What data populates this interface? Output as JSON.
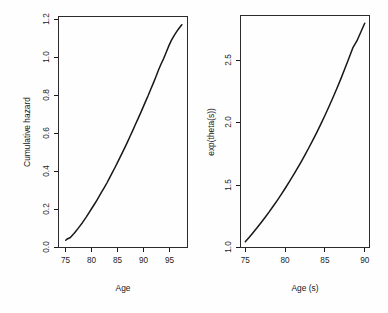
{
  "figure": {
    "background_color": "#fefefe",
    "foreground_color": "#171717",
    "panel_count": 2
  },
  "chart_data": [
    {
      "type": "line",
      "panel": "left",
      "title": "",
      "xlabel": "Age",
      "ylabel": "Cumulative hazard",
      "xlim": [
        73.6,
        98.6
      ],
      "ylim": [
        -0.035,
        1.235
      ],
      "xticks": [
        75,
        80,
        85,
        90,
        95
      ],
      "xticklabels": [
        "75",
        "80",
        "85",
        "90",
        "95"
      ],
      "yticks": [
        0.0,
        0.2,
        0.4,
        0.6,
        0.8,
        1.0,
        1.2
      ],
      "yticklabels": [
        "0.0",
        "0.2",
        "0.4",
        "0.6",
        "0.8",
        "1.0",
        "1.2"
      ],
      "grid": false,
      "legend": null,
      "series": [
        {
          "name": "Nelson-Aalen cumulative hazard",
          "x": [
            75.0,
            75.3,
            75.6,
            75.9,
            76.2,
            76.6,
            77.0,
            77.4,
            77.8,
            78.2,
            78.6,
            79.0,
            79.5,
            80.0,
            80.5,
            81.0,
            81.5,
            82.0,
            82.5,
            83.0,
            83.5,
            84.0,
            84.5,
            85.0,
            85.5,
            86.0,
            86.5,
            87.0,
            87.5,
            88.0,
            88.5,
            89.0,
            89.5,
            90.0,
            90.5,
            91.0,
            91.5,
            92.0,
            92.5,
            93.0,
            93.5,
            94.0,
            94.5,
            95.0,
            95.5,
            96.0,
            96.5,
            97.0,
            97.5
          ],
          "y": [
            0.005,
            0.012,
            0.016,
            0.02,
            0.03,
            0.042,
            0.056,
            0.07,
            0.085,
            0.1,
            0.117,
            0.133,
            0.155,
            0.178,
            0.2,
            0.223,
            0.247,
            0.272,
            0.296,
            0.321,
            0.348,
            0.375,
            0.402,
            0.43,
            0.459,
            0.488,
            0.517,
            0.547,
            0.578,
            0.609,
            0.641,
            0.672,
            0.704,
            0.737,
            0.77,
            0.802,
            0.836,
            0.87,
            0.905,
            0.942,
            0.975,
            1.005,
            1.04,
            1.075,
            1.105,
            1.13,
            1.152,
            1.172,
            1.19
          ]
        }
      ]
    },
    {
      "type": "line",
      "panel": "right",
      "title": "",
      "xlabel": "Age (s)",
      "ylabel": "exp(theta(s))",
      "xlim": [
        74.4,
        90.6
      ],
      "ylim": [
        0.955,
        2.76
      ],
      "xticks": [
        75,
        80,
        85,
        90
      ],
      "xticklabels": [
        "75",
        "80",
        "85",
        "90"
      ],
      "yticks": [
        1.0,
        1.5,
        2.0,
        2.5
      ],
      "yticklabels": [
        "1.0",
        "1.5",
        "2.0",
        "2.5"
      ],
      "grid": false,
      "legend": null,
      "series": [
        {
          "name": "exp(theta(s))",
          "x": [
            75.0,
            75.5,
            76.0,
            76.5,
            77.0,
            77.5,
            78.0,
            78.5,
            79.0,
            79.5,
            80.0,
            80.5,
            81.0,
            81.5,
            82.0,
            82.5,
            83.0,
            83.5,
            84.0,
            84.5,
            85.0,
            85.5,
            86.0,
            86.5,
            87.0,
            87.5,
            88.0,
            88.5,
            89.0,
            89.5,
            90.0
          ],
          "y": [
            1.0,
            1.035,
            1.072,
            1.11,
            1.15,
            1.19,
            1.232,
            1.276,
            1.32,
            1.366,
            1.414,
            1.463,
            1.514,
            1.566,
            1.62,
            1.676,
            1.733,
            1.792,
            1.853,
            1.917,
            1.982,
            2.05,
            2.12,
            2.192,
            2.267,
            2.345,
            2.425,
            2.508,
            2.56,
            2.63,
            2.7
          ]
        }
      ]
    }
  ]
}
